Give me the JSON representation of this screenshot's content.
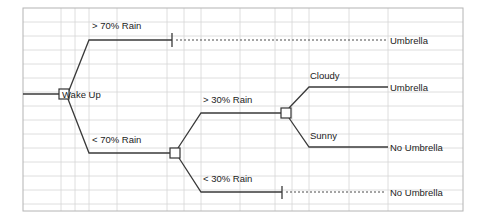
{
  "diagram": {
    "type": "decision-tree",
    "root": {
      "label": "Wake Up"
    },
    "branch_labels": {
      "rain_gt_70": "> 70% Rain",
      "rain_lt_70": "< 70% Rain",
      "rain_gt_30": "> 30% Rain",
      "rain_lt_30": "< 30% Rain",
      "cloudy": "Cloudy",
      "sunny": "Sunny"
    },
    "outcomes": {
      "umbrella_top": "Umbrella",
      "umbrella_cloudy": "Umbrella",
      "no_umbrella_sunny": "No Umbrella",
      "no_umbrella_bottom": "No Umbrella"
    },
    "colors": {
      "line": "#3a3a3a",
      "node_fill": "#ffffff",
      "node_stroke": "#333333",
      "grid_line": "#d0d0d0",
      "grid_border": "#b4b4b4",
      "text": "#1c1c1c",
      "background": "#ffffff"
    },
    "grid": {
      "row_height": 14,
      "column_x": [
        23,
        61,
        75,
        89,
        117,
        167,
        184,
        201,
        240,
        275,
        292,
        309,
        349,
        388,
        463
      ],
      "top": 8,
      "bottom": 211,
      "left": 23,
      "right": 463
    }
  }
}
